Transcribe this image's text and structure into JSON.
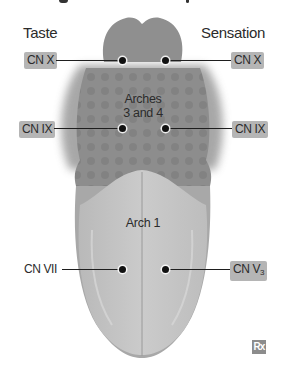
{
  "figure": {
    "columns": {
      "left": "Taste",
      "right": "Sensation"
    },
    "regions": {
      "upper": {
        "line1": "Arches",
        "line2": "3 and 4"
      },
      "lower": "Arch 1"
    },
    "labels": {
      "left_top": "CN X",
      "right_top": "CN X",
      "left_mid": "CN IX",
      "right_mid": "CN IX",
      "left_bottom": "CN VII",
      "right_bottom_base": "CN V",
      "right_bottom_sub": "3"
    },
    "badge": "Rx",
    "colors": {
      "posterior": "#8f8f8f",
      "middle": "#8a8a8a",
      "anterior": "#c4c4c4",
      "tag_bg": "#b5b5b5",
      "badge_bg": "#8c8c8c"
    }
  }
}
